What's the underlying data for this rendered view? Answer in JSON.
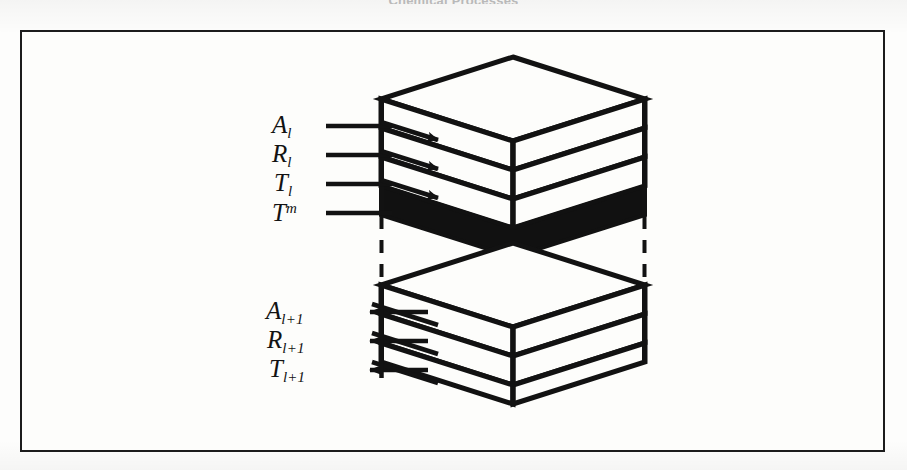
{
  "caption": {
    "top_text": "Chemical Processes"
  },
  "figure": {
    "frame": {
      "border_color": "#1c1c1c",
      "background": "#fdfdfb"
    },
    "stroke_color": "#121212",
    "fill_white": "#fdfdfb",
    "fill_black": "#111111"
  },
  "labels": {
    "upper": [
      {
        "id": "A-l",
        "base": "A",
        "sub": "l",
        "sup": "",
        "arrow": "right"
      },
      {
        "id": "R-l",
        "base": "R",
        "sub": "l",
        "sup": "",
        "arrow": "right"
      },
      {
        "id": "T-l",
        "base": "T",
        "sub": "l",
        "sup": "",
        "arrow": "right"
      },
      {
        "id": "T-m",
        "base": "T",
        "sub": "",
        "sup": "m",
        "arrow": "right"
      }
    ],
    "lower": [
      {
        "id": "A-l1",
        "base": "A",
        "sub": "l+1",
        "sup": "",
        "arrow": "left"
      },
      {
        "id": "R-l1",
        "base": "R",
        "sub": "l+1",
        "sup": "",
        "arrow": "left"
      },
      {
        "id": "T-l1",
        "base": "T",
        "sub": "l+1",
        "sup": "",
        "arrow": "left"
      }
    ]
  },
  "blocks": {
    "upper": {
      "name": "upper-layer-stack",
      "layers": [
        {
          "name": "layer-top",
          "fill": "white"
        },
        {
          "name": "layer-second",
          "fill": "white"
        },
        {
          "name": "layer-third",
          "fill": "white"
        },
        {
          "name": "layer-bottom",
          "fill": "black"
        }
      ]
    },
    "lower": {
      "name": "lower-layer-stack",
      "layers": [
        {
          "name": "layer-top",
          "fill": "white"
        },
        {
          "name": "layer-second",
          "fill": "white"
        },
        {
          "name": "layer-third",
          "fill": "white"
        }
      ]
    },
    "connectors": {
      "name": "dashed-connectors",
      "style": "dashed",
      "count": 3
    }
  }
}
